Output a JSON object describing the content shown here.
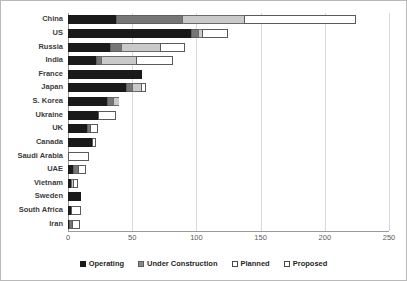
{
  "chart_data": {
    "type": "bar",
    "orientation": "horizontal",
    "stacked": true,
    "title": "",
    "xlabel": "",
    "ylabel": "",
    "xlim": [
      0,
      250
    ],
    "xticks": [
      0,
      50,
      100,
      150,
      200,
      250
    ],
    "grid": true,
    "legend_position": "bottom",
    "categories": [
      "China",
      "US",
      "Russia",
      "India",
      "France",
      "Japan",
      "S. Korea",
      "Ukraine",
      "UK",
      "Canada",
      "Saudi Arabia",
      "UAE",
      "Vietnam",
      "Sweden",
      "South Africa",
      "Iran"
    ],
    "series": [
      {
        "name": "Operating",
        "color": "#1a1a1a",
        "values": [
          37,
          96,
          33,
          22,
          58,
          45,
          30,
          23,
          15,
          19,
          0,
          4,
          2,
          10,
          2,
          1
        ]
      },
      {
        "name": "Under Construction",
        "color": "#767676",
        "values": [
          52,
          5,
          8,
          4,
          0,
          5,
          5,
          0,
          2,
          0,
          0,
          4,
          0,
          0,
          0,
          2
        ]
      },
      {
        "name": "Planned",
        "color": "#c9c9c9",
        "values": [
          48,
          3,
          31,
          27,
          0,
          7,
          5,
          0,
          0,
          0,
          0,
          0,
          2,
          0,
          0,
          0
        ]
      },
      {
        "name": "Proposed",
        "color": "#ffffff",
        "values": [
          87,
          21,
          19,
          29,
          0,
          4,
          0,
          14,
          6,
          3,
          16,
          6,
          4,
          0,
          8,
          6
        ]
      }
    ],
    "totals": [
      224,
      125,
      91,
      82,
      58,
      61,
      40,
      37,
      23,
      22,
      16,
      14,
      8,
      10,
      10,
      9
    ]
  },
  "legend": {
    "items": [
      {
        "label": "Operating",
        "key": "operating"
      },
      {
        "label": "Under Construction",
        "key": "under-construction"
      },
      {
        "label": "Planned",
        "key": "planned"
      },
      {
        "label": "Proposed",
        "key": "proposed"
      }
    ]
  }
}
